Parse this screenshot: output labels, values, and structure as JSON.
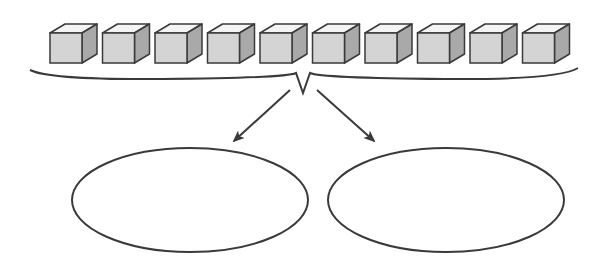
{
  "diagram": {
    "background": "#ffffff",
    "stroke_color": "#3a3a3a",
    "cubes": {
      "count": 10,
      "start_x": 50,
      "pitch": 52.5,
      "front_top_y": 33,
      "front_width": 32,
      "front_height": 30,
      "depth_dx": 15,
      "depth_dy": 9,
      "front_color": "#d4d4d4",
      "top_color": "#f4f4f4",
      "side_color": "#a9a9a9"
    },
    "brace": {
      "left_x": 30,
      "right_x": 578,
      "end_y": 70,
      "mid_y": 80,
      "cusp_left_x": 296,
      "cusp_right_x": 310,
      "cusp_y": 73,
      "tip_x": 303,
      "tip_y": 93
    },
    "arrows": [
      {
        "from": [
          290,
          90
        ],
        "to": [
          234,
          141
        ]
      },
      {
        "from": [
          317,
          90
        ],
        "to": [
          374,
          141
        ]
      }
    ],
    "groups": [
      {
        "cx": 190,
        "cy": 200,
        "rx": 118,
        "ry": 52,
        "label": ""
      },
      {
        "cx": 446,
        "cy": 200,
        "rx": 118,
        "ry": 52,
        "label": ""
      }
    ]
  }
}
